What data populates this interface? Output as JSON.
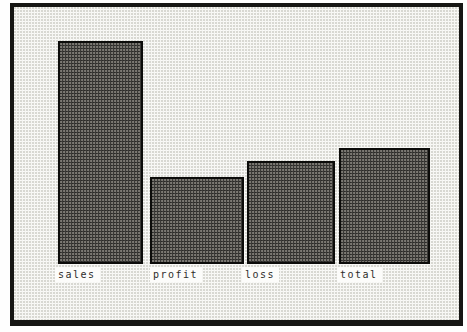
{
  "frame": {
    "border_color": "#161614",
    "background_color": "#f6f6f3"
  },
  "chart_data": {
    "type": "bar",
    "title": "",
    "xlabel": "",
    "ylabel": "",
    "categories": [
      "sales",
      "profit",
      "loss",
      "total"
    ],
    "values": [
      100,
      39,
      46,
      52
    ],
    "ylim": [
      0,
      100
    ],
    "grid": false,
    "legend": false,
    "bar_color": "#3a3936",
    "bar_border_color": "#0c0c0a",
    "label_box_color": "#fcfcfa",
    "label_text_color": "#2e2d2a"
  }
}
